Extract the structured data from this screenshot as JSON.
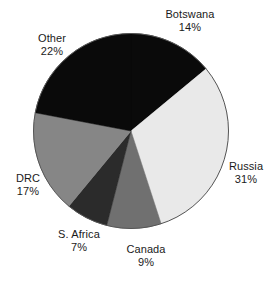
{
  "chart_data": {
    "type": "pie",
    "title": "",
    "subtitle": "",
    "xlabel": "",
    "ylabel": "",
    "legend_position": "none",
    "grid": false,
    "start_angle_deg": 0,
    "direction": "clockwise",
    "units": "percent",
    "categories": [
      "Botswana",
      "Russia",
      "Canada",
      "S. Africa",
      "DRC",
      "Other"
    ],
    "values": [
      14,
      31,
      9,
      7,
      17,
      22
    ],
    "slices": [
      {
        "name": "Botswana",
        "value": 14,
        "percent_text": "14%",
        "color": "#0a0a0a",
        "label_position": "top-right"
      },
      {
        "name": "Russia",
        "value": 31,
        "percent_text": "31%",
        "color": "#e9e9e9",
        "label_position": "right"
      },
      {
        "name": "Canada",
        "value": 9,
        "percent_text": "9%",
        "color": "#707070",
        "label_position": "bottom"
      },
      {
        "name": "S. Africa",
        "value": 7,
        "percent_text": "7%",
        "color": "#2b2b2b",
        "label_position": "bottom-left"
      },
      {
        "name": "DRC",
        "value": 17,
        "percent_text": "17%",
        "color": "#868686",
        "label_position": "left"
      },
      {
        "name": "Other",
        "value": 22,
        "percent_text": "22%",
        "color": "#0a0a0a",
        "label_position": "top-left"
      }
    ],
    "colors": {
      "outline": "#555555",
      "text": "#1a1a1a",
      "background": "#ffffff"
    }
  },
  "labels": {
    "botswana": {
      "name": "Botswana",
      "pct": "14%"
    },
    "russia": {
      "name": "Russia",
      "pct": "31%"
    },
    "canada": {
      "name": "Canada",
      "pct": "9%"
    },
    "safrica": {
      "name": "S. Africa",
      "pct": "7%"
    },
    "drc": {
      "name": "DRC",
      "pct": "17%"
    },
    "other": {
      "name": "Other",
      "pct": "22%"
    }
  }
}
